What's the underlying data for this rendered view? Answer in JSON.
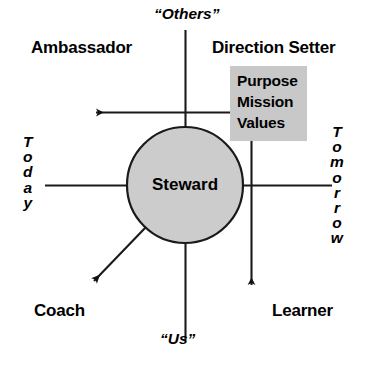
{
  "diagram": {
    "center_node": {
      "label": "Steward",
      "shape": "circle",
      "fill_color": "#cccccc",
      "stroke_color": "#000000"
    },
    "quadrant_roles": [
      {
        "id": "ambassador",
        "label": "Ambassador",
        "position": "top-left"
      },
      {
        "id": "direction-setter",
        "label": "Direction Setter",
        "position": "top-right"
      },
      {
        "id": "coach",
        "label": "Coach",
        "position": "bottom-left"
      },
      {
        "id": "learner",
        "label": "Learner",
        "position": "bottom-right"
      }
    ],
    "axes": {
      "vertical": {
        "top_label": "“Others”",
        "bottom_label": "“Us”"
      },
      "horizontal": {
        "left_label": "Today",
        "right_label": "Tomorrow",
        "left_label_letters": [
          "T",
          "o",
          "d",
          "a",
          "y"
        ],
        "right_label_letters": [
          "T",
          "o",
          "m",
          "o",
          "r",
          "r",
          "o",
          "w"
        ]
      }
    },
    "vision_box": {
      "fill_color": "#c8c8c8",
      "lines": [
        "Purpose",
        "Mission",
        "Values"
      ]
    },
    "arrows": [
      {
        "id": "arrow-to-ambassador",
        "direction": "left",
        "from": "vision-box",
        "to": "ambassador-quadrant"
      },
      {
        "id": "arrow-to-learner",
        "direction": "down",
        "from": "vision-box",
        "to": "learner-quadrant"
      },
      {
        "id": "arrow-to-coach",
        "direction": "down-left",
        "from": "steward-circle",
        "to": "coach-quadrant"
      }
    ],
    "colors": {
      "line": "#000000",
      "text": "#000000",
      "background": "#ffffff",
      "shade": "#cccccc"
    }
  }
}
